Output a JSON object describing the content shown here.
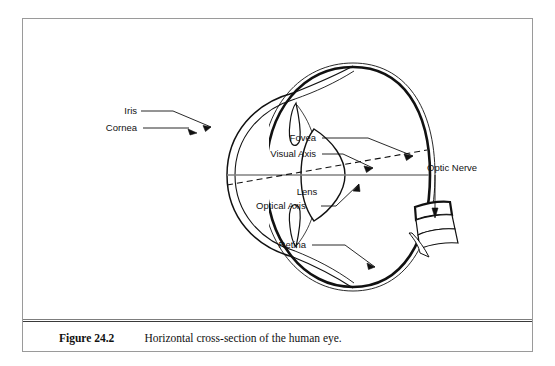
{
  "figure": {
    "caption_label": "Figure 24.2",
    "caption_text": "Horizontal cross-section of the human eye.",
    "title": "Horizontal cross-section of the human eye"
  },
  "diagram": {
    "labels": {
      "iris": "Iris",
      "cornea": "Cornea",
      "lens": "Lens",
      "fovea": "Fovea",
      "visual_axis": "Visual Axis",
      "optical_axis": "Optical Axis",
      "retina": "Retina",
      "optic_nerve": "Optic Nerve"
    },
    "parts": [
      {
        "name": "sclera",
        "label": ""
      },
      {
        "name": "cornea",
        "label": "Cornea"
      },
      {
        "name": "iris",
        "label": "Iris"
      },
      {
        "name": "lens",
        "label": "Lens"
      },
      {
        "name": "retina",
        "label": "Retina"
      },
      {
        "name": "fovea",
        "label": "Fovea"
      },
      {
        "name": "optic-nerve",
        "label": "Optic Nerve"
      },
      {
        "name": "visual-axis",
        "label": "Visual Axis"
      },
      {
        "name": "optical-axis",
        "label": "Optical Axis"
      }
    ],
    "colors": {
      "ink": "#111111",
      "axis": "#808080",
      "frame": "#9a9a9a",
      "background": "#ffffff"
    }
  }
}
